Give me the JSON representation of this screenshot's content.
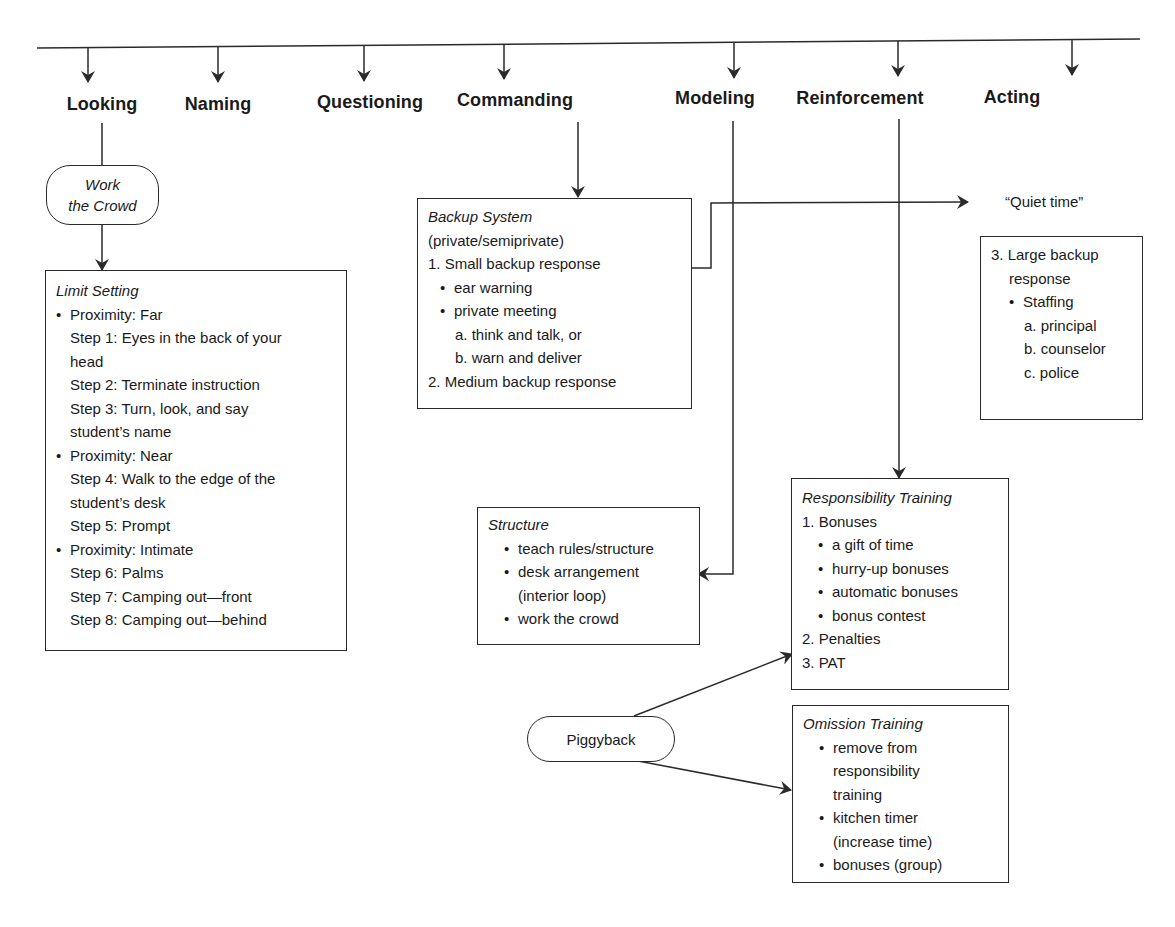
{
  "stages": [
    {
      "id": "looking",
      "label": "Looking"
    },
    {
      "id": "naming",
      "label": "Naming"
    },
    {
      "id": "questioning",
      "label": "Questioning"
    },
    {
      "id": "commanding",
      "label": "Commanding"
    },
    {
      "id": "modeling",
      "label": "Modeling"
    },
    {
      "id": "reinforcement",
      "label": "Reinforcement"
    },
    {
      "id": "acting",
      "label": "Acting"
    }
  ],
  "work_the_crowd": {
    "line1": "Work",
    "line2": "the Crowd"
  },
  "limit_setting": {
    "title": "Limit Setting",
    "lines": [
      {
        "type": "bullet",
        "text": "Proximity: Far"
      },
      {
        "type": "step",
        "text": "Step 1: Eyes in the back of your"
      },
      {
        "type": "step",
        "text": "head"
      },
      {
        "type": "step",
        "text": "Step 2: Terminate instruction"
      },
      {
        "type": "step",
        "text": "Step 3: Turn, look, and say"
      },
      {
        "type": "step",
        "text": "student’s name"
      },
      {
        "type": "bullet",
        "text": "Proximity: Near"
      },
      {
        "type": "step",
        "text": "Step 4: Walk to the edge of the"
      },
      {
        "type": "step",
        "text": "student’s desk"
      },
      {
        "type": "step",
        "text": "Step 5: Prompt"
      },
      {
        "type": "bullet",
        "text": "Proximity: Intimate"
      },
      {
        "type": "step",
        "text": "Step 6: Palms"
      },
      {
        "type": "step",
        "text": "Step 7: Camping out—front"
      },
      {
        "type": "step",
        "text": "Step 8: Camping out—behind"
      }
    ]
  },
  "backup_system": {
    "title": "Backup System",
    "lines": [
      {
        "type": "plain",
        "text": "(private/semiprivate)"
      },
      {
        "type": "plain",
        "text": "1. Small backup response"
      },
      {
        "type": "bullet",
        "text": "ear warning"
      },
      {
        "type": "bullet",
        "text": "private meeting"
      },
      {
        "type": "sub",
        "text": "a. think and talk, or"
      },
      {
        "type": "sub",
        "text": "b. warn and deliver"
      },
      {
        "type": "plain",
        "text": "2.  Medium backup response"
      }
    ]
  },
  "quiet_time": {
    "label": "“Quiet time”"
  },
  "large_backup": {
    "lines": [
      {
        "type": "plain",
        "text": "3. Large backup"
      },
      {
        "type": "cont",
        "text": "response"
      },
      {
        "type": "bullet",
        "text": "Staffing"
      },
      {
        "type": "sub",
        "text": "a. principal"
      },
      {
        "type": "sub",
        "text": "b. counselor"
      },
      {
        "type": "sub",
        "text": "c. police"
      }
    ]
  },
  "structure": {
    "title": "Structure",
    "lines": [
      {
        "type": "bullet",
        "text": "teach rules/structure"
      },
      {
        "type": "bullet",
        "text": "desk arrangement"
      },
      {
        "type": "cont",
        "text": "(interior loop)"
      },
      {
        "type": "bullet",
        "text": "work the crowd"
      }
    ]
  },
  "responsibility_training": {
    "title": "Responsibility Training",
    "lines": [
      {
        "type": "plain",
        "text": "1.  Bonuses"
      },
      {
        "type": "bullet",
        "text": "a gift of time"
      },
      {
        "type": "bullet",
        "text": "hurry-up bonuses"
      },
      {
        "type": "bullet",
        "text": "automatic bonuses"
      },
      {
        "type": "bullet",
        "text": "bonus contest"
      },
      {
        "type": "plain",
        "text": "2.  Penalties"
      },
      {
        "type": "plain",
        "text": "3.  PAT"
      }
    ]
  },
  "omission_training": {
    "title": "Omission Training",
    "lines": [
      {
        "type": "bullet",
        "text": "remove from"
      },
      {
        "type": "cont",
        "text": "responsibility"
      },
      {
        "type": "cont",
        "text": "training"
      },
      {
        "type": "bullet",
        "text": "kitchen timer"
      },
      {
        "type": "cont",
        "text": "(increase time)"
      },
      {
        "type": "bullet",
        "text": "bonuses (group)"
      }
    ]
  },
  "piggyback": {
    "label": "Piggyback"
  },
  "colors": {
    "ink": "#2a2a2a",
    "background": "#ffffff"
  }
}
